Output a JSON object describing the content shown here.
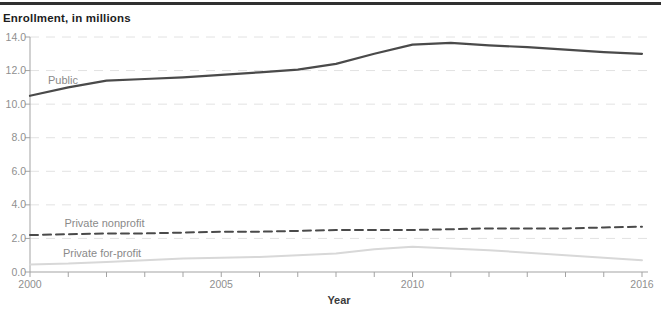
{
  "page": {
    "title": "Enrollment, in millions"
  },
  "colors": {
    "rule": "#303030",
    "title_text": "#1d1d1d",
    "axis": "#a3a3a3",
    "grid": "#e2e2e2",
    "tick_text": "#8f8f8f",
    "series_label_text": "#8a8a8a",
    "dark_line": "#4a4a4a",
    "light_line": "#d8d8d8"
  },
  "chart_data": {
    "type": "line",
    "title": "Enrollment, in millions",
    "xlabel": "Year",
    "ylabel": "Enrollment, in millions",
    "x": [
      2000,
      2001,
      2002,
      2003,
      2004,
      2005,
      2006,
      2007,
      2008,
      2009,
      2010,
      2011,
      2012,
      2013,
      2014,
      2015,
      2016
    ],
    "x_tick_labels": [
      "2000",
      "2005",
      "2010",
      "2016"
    ],
    "ylim": [
      0,
      14
    ],
    "ytick_step": 2,
    "y_tick_labels": [
      "0.0",
      "2.0",
      "4.0",
      "6.0",
      "8.0",
      "10.0",
      "12.0",
      "14.0"
    ],
    "grid": "horizontal-dashed",
    "legend": "inline-series-labels",
    "series": [
      {
        "name": "Public",
        "values": [
          10.5,
          11.0,
          11.4,
          11.5,
          11.6,
          11.75,
          11.9,
          12.05,
          12.4,
          13.0,
          13.55,
          13.65,
          13.5,
          13.4,
          13.25,
          13.1,
          13.0
        ],
        "color": "#4a4a4a",
        "dash": "",
        "width": 2.2,
        "label": {
          "text": "Public",
          "year": 2000.47,
          "value": 11.2
        }
      },
      {
        "name": "Private nonprofit",
        "values": [
          2.2,
          2.25,
          2.3,
          2.3,
          2.35,
          2.4,
          2.4,
          2.45,
          2.5,
          2.5,
          2.5,
          2.55,
          2.6,
          2.6,
          2.6,
          2.65,
          2.7
        ],
        "color": "#4a4a4a",
        "dash": "8 5",
        "width": 2,
        "label": {
          "text": "Private nonprofit",
          "year": 2000.9,
          "value": 2.7
        }
      },
      {
        "name": "Private for-profit",
        "values": [
          0.45,
          0.5,
          0.6,
          0.7,
          0.8,
          0.85,
          0.9,
          1.0,
          1.1,
          1.35,
          1.5,
          1.4,
          1.3,
          1.15,
          1.0,
          0.85,
          0.7
        ],
        "color": "#d8d8d8",
        "dash": "",
        "width": 2,
        "label": {
          "text": "Private for-profit",
          "year": 2000.86,
          "value": 0.9
        }
      }
    ]
  }
}
